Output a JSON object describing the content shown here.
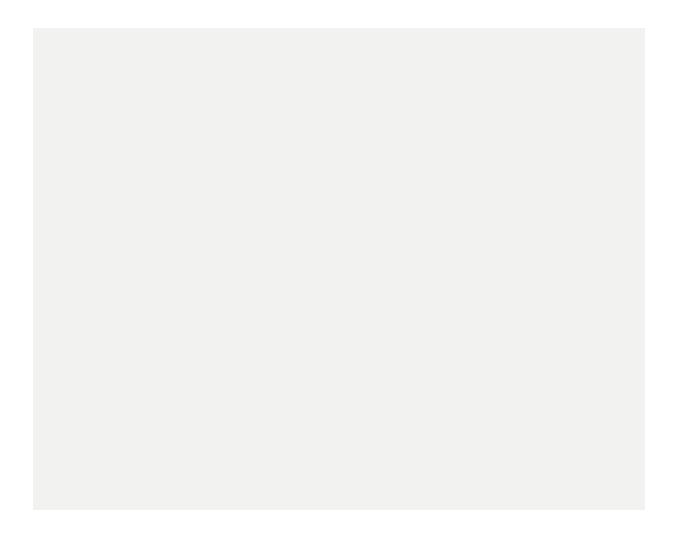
{
  "figure": {
    "background": "#f2f2f0",
    "page_background": "#ffffff"
  },
  "chart_data": {
    "type": "line",
    "title": "",
    "xlabel": "Age of mother / years",
    "ylabel": "Average family size (number of live-born children)",
    "ylabel_line1": "Average family size",
    "ylabel_line2": "(number of live-born children)",
    "xlim": [
      15,
      45
    ],
    "ylim": [
      0.0,
      2.2
    ],
    "xticks": [
      15,
      20,
      25,
      30,
      35,
      40,
      45
    ],
    "xticklabels": [
      "15",
      "20",
      "25",
      "30",
      "35",
      "40",
      "45"
    ],
    "yticks": [
      0.0,
      0.2,
      0.4,
      0.6,
      0.8,
      1.0,
      1.2,
      1.4,
      1.6,
      1.8,
      2.0,
      2.2
    ],
    "yticklabels": [
      "0.0",
      "0.2",
      "0.4",
      "0.6",
      "0.8",
      "1.0",
      "1.2",
      "1.4",
      "1.6",
      "1.8",
      "2.0",
      "2.2"
    ],
    "grid": false,
    "legend": "inline-annotations",
    "x": [
      15,
      16,
      17,
      18,
      19,
      20,
      21,
      22,
      23,
      24,
      25,
      26,
      27,
      28,
      29,
      30,
      31,
      32,
      33,
      34,
      35,
      36,
      37,
      38,
      39,
      40,
      41,
      42,
      43,
      44,
      45
    ],
    "series": [
      {
        "name": "born 1944",
        "label": "born 1944",
        "color": "#a8a8a8",
        "values": [
          0.0,
          0.02,
          0.05,
          0.1,
          0.17,
          0.27,
          0.4,
          0.55,
          0.72,
          0.9,
          1.07,
          1.24,
          1.39,
          1.53,
          1.65,
          1.76,
          1.85,
          1.93,
          1.99,
          2.04,
          2.09,
          2.12,
          2.15,
          2.17,
          2.18,
          2.19,
          2.2,
          2.2,
          2.21,
          2.21,
          2.21
        ]
      },
      {
        "name": "born 1949",
        "label": "born 1949",
        "color": "#6e6e6e",
        "values": [
          0.0,
          0.02,
          0.05,
          0.1,
          0.18,
          0.28,
          0.41,
          0.56,
          0.72,
          0.89,
          1.05,
          1.21,
          1.36,
          1.49,
          1.61,
          1.71,
          1.8,
          1.87,
          1.93,
          1.97,
          2.01,
          2.03,
          2.05,
          2.06,
          2.07,
          2.08,
          2.08,
          2.09,
          2.09,
          2.09,
          2.09
        ]
      },
      {
        "name": "born 1954",
        "label": "born 1954",
        "color": "#4d4d4d",
        "values": [
          0.0,
          0.02,
          0.04,
          0.09,
          0.15,
          0.24,
          0.35,
          0.48,
          0.63,
          0.79,
          0.95,
          1.11,
          1.26,
          1.4,
          1.52,
          1.63,
          1.73,
          1.81,
          1.87,
          1.92,
          1.96,
          1.99,
          2.01,
          2.02,
          2.03,
          2.04,
          null,
          null,
          null,
          null,
          null
        ]
      },
      {
        "name": "born 1959",
        "label": "born 1959",
        "color": "#bdbdbd",
        "values": [
          0.0,
          0.01,
          0.03,
          0.07,
          0.12,
          0.19,
          0.28,
          0.4,
          0.53,
          0.67,
          0.82,
          0.97,
          1.12,
          1.26,
          1.39,
          1.51,
          1.61,
          1.7,
          1.78,
          1.84,
          1.89,
          1.93,
          1.96,
          1.98,
          1.99,
          2.0,
          null,
          null,
          null,
          null,
          null
        ]
      },
      {
        "name": "born 1964",
        "label": "born 1964",
        "color": "#9c9c9c",
        "values": [
          0.0,
          0.01,
          0.03,
          0.06,
          0.1,
          0.16,
          0.24,
          0.34,
          0.46,
          0.59,
          0.73,
          0.88,
          1.02,
          1.16,
          1.29,
          1.41,
          1.52,
          1.61,
          1.69,
          1.75,
          1.8,
          null,
          null,
          null,
          null,
          null,
          null,
          null,
          null,
          null,
          null
        ]
      },
      {
        "name": "born 1969",
        "label": "born 1969",
        "color": "#c9c9c9",
        "values": [
          0.0,
          0.01,
          0.02,
          0.05,
          0.09,
          0.14,
          0.21,
          0.3,
          0.41,
          0.53,
          0.66,
          0.79,
          0.92,
          1.05,
          1.17,
          1.28,
          null,
          null,
          null,
          null,
          null,
          null,
          null,
          null,
          null,
          null,
          null,
          null,
          null,
          null,
          null
        ]
      }
    ],
    "annotations": [
      {
        "text": "born 1944",
        "x_px": 238,
        "y_px": 104
      },
      {
        "text": "born 1949",
        "x_px": 238,
        "y_px": 140
      },
      {
        "text": "born 1954",
        "x_px": 238,
        "y_px": 176
      },
      {
        "text": "born 1959",
        "x_px": 478,
        "y_px": 141
      },
      {
        "text": "born 1964",
        "x_px": 400,
        "y_px": 215
      },
      {
        "text": "born 1969",
        "x_px": 330,
        "y_px": 323
      }
    ]
  }
}
